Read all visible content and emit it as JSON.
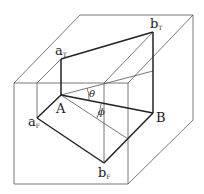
{
  "diagram": {
    "type": "3d-projection-box",
    "labels": {
      "aT": {
        "main": "a",
        "sub": "T"
      },
      "bT": {
        "main": "b",
        "sub": "T"
      },
      "A": {
        "main": "A"
      },
      "B": {
        "main": "B"
      },
      "aF": {
        "main": "a",
        "sub": "F"
      },
      "bF": {
        "main": "b",
        "sub": "F"
      },
      "theta": "θ",
      "phi": "ϕ"
    },
    "colors": {
      "line": "#222222",
      "thin": "#555555",
      "background": "#ffffff"
    }
  }
}
